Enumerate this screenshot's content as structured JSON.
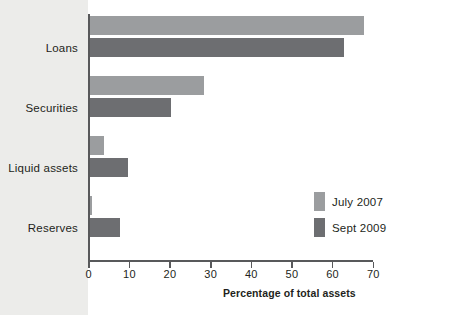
{
  "chart_data": {
    "type": "bar",
    "orientation": "horizontal",
    "title": "",
    "subtitle": "",
    "xlabel": "Percentage of total assets",
    "ylabel": "",
    "categories": [
      "Loans",
      "Securities",
      "Liquid assets",
      "Reserves"
    ],
    "series": [
      {
        "name": "July 2007",
        "color": "#9b9d9f",
        "values": [
          67.5,
          28.0,
          3.5,
          0.5
        ]
      },
      {
        "name": "Sept 2009",
        "color": "#6d6e71",
        "values": [
          62.5,
          19.8,
          9.4,
          7.5
        ]
      }
    ],
    "xlim": [
      0,
      70
    ],
    "xticks": [
      0,
      10,
      20,
      30,
      40,
      50,
      60,
      70
    ],
    "xtick_labels": [
      "0",
      "10",
      "20",
      "30",
      "40",
      "50",
      "60",
      "70"
    ],
    "grid": false,
    "legend_position": "inside-right"
  },
  "axis": {
    "x_title": "Percentage of total assets",
    "ticks": [
      {
        "label": "0"
      },
      {
        "label": "10"
      },
      {
        "label": "20"
      },
      {
        "label": "30"
      },
      {
        "label": "40"
      },
      {
        "label": "50"
      },
      {
        "label": "60"
      },
      {
        "label": "70"
      }
    ]
  },
  "categories": [
    {
      "label": "Loans"
    },
    {
      "label": "Securities"
    },
    {
      "label": "Liquid assets"
    },
    {
      "label": "Reserves"
    }
  ],
  "legend": {
    "items": [
      {
        "label": "July 2007",
        "color": "#9b9d9f"
      },
      {
        "label": "Sept 2009",
        "color": "#6d6e71"
      }
    ]
  },
  "colors": {
    "series_light": "#9b9d9f",
    "series_dark": "#6d6e71",
    "axis": "#58595b",
    "text": "#231f20",
    "page_band": "#ececea",
    "plot_background": "#ffffff"
  }
}
